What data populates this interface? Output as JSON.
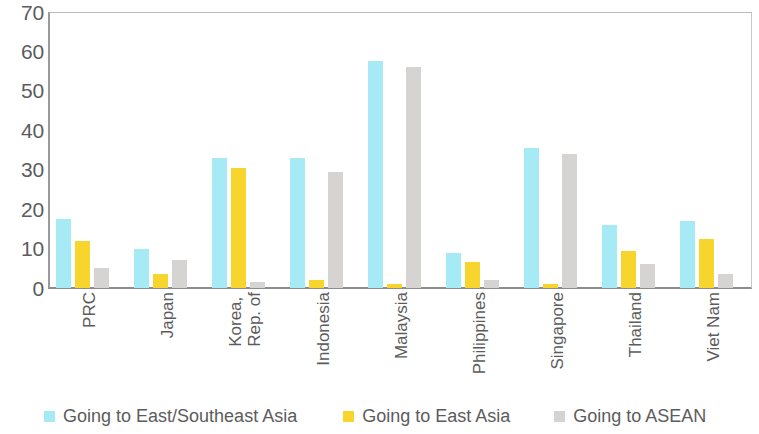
{
  "chart_data": {
    "type": "bar",
    "title": "",
    "subtitle": "",
    "xlabel": "",
    "ylabel": "",
    "ylim": [
      0,
      70
    ],
    "yticks": [
      0,
      10,
      20,
      30,
      40,
      50,
      60,
      70
    ],
    "grid": false,
    "legend_position": "bottom",
    "categories": [
      "PRC",
      "Japan",
      "Korea, Rep. of",
      "Indonesia",
      "Malaysia",
      "Philippines",
      "Singapore",
      "Thailand",
      "Viet Nam"
    ],
    "category_lines": [
      [
        "PRC"
      ],
      [
        "Japan"
      ],
      [
        "Korea,",
        "Rep. of"
      ],
      [
        "Indonesia"
      ],
      [
        "Malaysia"
      ],
      [
        "Philippines"
      ],
      [
        "Singapore"
      ],
      [
        "Thailand"
      ],
      [
        "Viet Nam"
      ]
    ],
    "series": [
      {
        "name": "Going to East/Southeast Asia",
        "color": "#a6eaf5",
        "values": [
          17.5,
          10,
          33,
          33,
          57.5,
          9,
          35.5,
          16,
          17
        ]
      },
      {
        "name": "Going to East Asia",
        "color": "#f7d52c",
        "values": [
          12,
          3.5,
          30.5,
          2,
          1,
          6.5,
          1,
          9.5,
          12.5
        ]
      },
      {
        "name": "Going to ASEAN",
        "color": "#d6d4d2",
        "values": [
          5,
          7,
          1.5,
          29.5,
          56,
          2,
          34,
          6,
          3.5
        ]
      }
    ]
  },
  "legend": {
    "items": [
      {
        "label": "Going to East/Southeast Asia",
        "color": "#a6eaf5"
      },
      {
        "label": "Going to East Asia",
        "color": "#f7d52c"
      },
      {
        "label": "Going to ASEAN",
        "color": "#d6d4d2"
      }
    ]
  },
  "axis": {
    "y_tick_labels": [
      "70",
      "60",
      "50",
      "40",
      "30",
      "20",
      "10",
      "0"
    ]
  }
}
